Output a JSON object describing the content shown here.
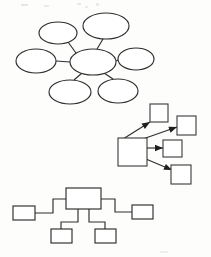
{
  "page": {
    "width": 211,
    "height": 257,
    "background_color": "#fdfdfc",
    "ink_color": "#2e2e2e",
    "has_text_labels": false
  },
  "diagrams": [
    {
      "id": "radial-hub-diagram",
      "name": "radial-hub-diagram",
      "type": "hub-and-spoke",
      "node_shape": "ellipse",
      "node_count": 7,
      "spoke_count": 6,
      "label": "",
      "hub": {
        "name": "hub-node",
        "cx": 93,
        "cy": 62,
        "rx": 23,
        "ry": 13,
        "label": ""
      },
      "spokes": [
        {
          "name": "spoke-node-top-left",
          "cx": 58,
          "cy": 33,
          "rx": 19,
          "ry": 11,
          "label": ""
        },
        {
          "name": "spoke-node-top-right",
          "cx": 106,
          "cy": 26,
          "rx": 23,
          "ry": 13,
          "label": ""
        },
        {
          "name": "spoke-node-left",
          "cx": 36,
          "cy": 61,
          "rx": 20,
          "ry": 12,
          "label": ""
        },
        {
          "name": "spoke-node-right",
          "cx": 136,
          "cy": 59,
          "rx": 18,
          "ry": 11,
          "label": ""
        },
        {
          "name": "spoke-node-bottom-left",
          "cx": 70,
          "cy": 92,
          "rx": 21,
          "ry": 12,
          "label": ""
        },
        {
          "name": "spoke-node-bottom-right",
          "cx": 118,
          "cy": 91,
          "rx": 20,
          "ry": 12,
          "label": ""
        }
      ],
      "edges": [
        {
          "name": "edge-hub-to-top-left",
          "from": "hub-node",
          "to": "spoke-node-top-left",
          "x1": 76,
          "y1": 53,
          "x2": 68,
          "y2": 42,
          "directed": false
        },
        {
          "name": "edge-hub-to-top-right",
          "from": "hub-node",
          "to": "spoke-node-top-right",
          "x1": 97,
          "y1": 49,
          "x2": 103,
          "y2": 39,
          "directed": false
        },
        {
          "name": "edge-hub-to-left",
          "from": "hub-node",
          "to": "spoke-node-left",
          "x1": 70,
          "y1": 62,
          "x2": 56,
          "y2": 61,
          "directed": false
        },
        {
          "name": "edge-hub-to-right",
          "from": "hub-node",
          "to": "spoke-node-right",
          "x1": 116,
          "y1": 61,
          "x2": 118,
          "y2": 60,
          "directed": false
        },
        {
          "name": "edge-hub-to-bottom-left",
          "from": "hub-node",
          "to": "spoke-node-bottom-left",
          "x1": 82,
          "y1": 73,
          "x2": 74,
          "y2": 80,
          "directed": false
        },
        {
          "name": "edge-hub-to-bottom-right",
          "from": "hub-node",
          "to": "spoke-node-bottom-right",
          "x1": 104,
          "y1": 73,
          "x2": 113,
          "y2": 79,
          "directed": false
        }
      ]
    },
    {
      "id": "arrow-flow-diagram",
      "name": "arrow-flow-diagram",
      "type": "directed-flow",
      "node_shape": "rectangle",
      "node_count": 5,
      "arrow_count": 4,
      "label": "",
      "source": {
        "name": "flow-source-box",
        "x": 118,
        "y": 138,
        "w": 29,
        "h": 28,
        "label": ""
      },
      "targets": [
        {
          "name": "flow-target-box-top",
          "x": 150,
          "y": 104,
          "w": 18,
          "h": 18,
          "label": ""
        },
        {
          "name": "flow-target-box-upper-right",
          "x": 177,
          "y": 116,
          "w": 19,
          "h": 19,
          "label": ""
        },
        {
          "name": "flow-target-box-middle-right",
          "x": 163,
          "y": 140,
          "w": 19,
          "h": 17,
          "label": ""
        },
        {
          "name": "flow-target-box-lower-right",
          "x": 171,
          "y": 165,
          "w": 20,
          "h": 19,
          "label": ""
        }
      ],
      "arrows": [
        {
          "name": "arrow-source-to-top",
          "from": "flow-source-box",
          "to": "flow-target-box-top",
          "x1": 123,
          "y1": 139,
          "x2": 150,
          "y2": 122,
          "directed": true
        },
        {
          "name": "arrow-source-to-upper-right",
          "from": "flow-source-box",
          "to": "flow-target-box-upper-right",
          "x1": 140,
          "y1": 140,
          "x2": 177,
          "y2": 127,
          "directed": true
        },
        {
          "name": "arrow-source-to-middle-right",
          "from": "flow-source-box",
          "to": "flow-target-box-middle-right",
          "x1": 147,
          "y1": 148,
          "x2": 163,
          "y2": 148,
          "directed": true
        },
        {
          "name": "arrow-source-to-lower-right",
          "from": "flow-source-box",
          "to": "flow-target-box-lower-right",
          "x1": 146,
          "y1": 159,
          "x2": 172,
          "y2": 170,
          "directed": true
        }
      ]
    },
    {
      "id": "hierarchy-tree-diagram",
      "name": "hierarchy-tree-diagram",
      "type": "org-chart",
      "node_shape": "rectangle",
      "node_count": 5,
      "levels": 2,
      "label": "",
      "root": {
        "name": "tree-root-box",
        "x": 66,
        "y": 188,
        "w": 35,
        "h": 21,
        "label": ""
      },
      "children": [
        {
          "name": "tree-child-box-far-left",
          "x": 13,
          "y": 206,
          "w": 22,
          "h": 14,
          "label": "",
          "side": "left"
        },
        {
          "name": "tree-child-box-far-right",
          "x": 132,
          "y": 205,
          "w": 21,
          "h": 14,
          "label": "",
          "side": "right"
        },
        {
          "name": "tree-child-box-bottom-left",
          "x": 51,
          "y": 229,
          "w": 21,
          "h": 14,
          "label": "",
          "side": "bottom"
        },
        {
          "name": "tree-child-box-bottom-right",
          "x": 95,
          "y": 229,
          "w": 21,
          "h": 14,
          "label": "",
          "side": "bottom"
        }
      ],
      "connectors": [
        {
          "name": "connector-root-to-far-left",
          "from": "tree-root-box",
          "to": "tree-child-box-far-left",
          "path": "M 66 199 L 53 199 L 53 213 L 35 213",
          "directed": false
        },
        {
          "name": "connector-root-to-far-right",
          "from": "tree-root-box",
          "to": "tree-child-box-far-right",
          "path": "M 101 199 L 115 199 L 115 212 L 132 212",
          "directed": false
        },
        {
          "name": "connector-root-to-bottom-left",
          "from": "tree-root-box",
          "to": "tree-child-box-bottom-left",
          "path": "M 78 209 L 78 222 L 61 222 L 61 229",
          "directed": false
        },
        {
          "name": "connector-root-to-bottom-right",
          "from": "tree-root-box",
          "to": "tree-child-box-bottom-right",
          "path": "M 89 209 L 89 222 L 105 222 L 105 229",
          "directed": false
        }
      ]
    }
  ]
}
